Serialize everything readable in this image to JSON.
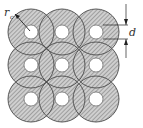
{
  "diagram": {
    "type": "circle-packing-grid",
    "rows": 3,
    "cols": 3,
    "centers_x": [
      31,
      62,
      96
    ],
    "centers_y": [
      32,
      65,
      99
    ],
    "outer_radius": 23,
    "hole_radius": 7,
    "fill_pattern": "diagonal-hatch",
    "colors": {
      "fill": "#c8c8c8",
      "hatch": "#6e6e6e",
      "stroke": "#4a4a4a",
      "hole": "#ffffff"
    },
    "labels": {
      "radius": "r",
      "radius_subscript": "c",
      "dimension": "d"
    }
  }
}
